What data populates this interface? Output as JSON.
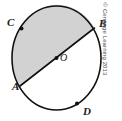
{
  "figure": {
    "type": "geometry-diagram",
    "shape": "circle",
    "circle": {
      "center_label": "O",
      "center": {
        "x": 56.5,
        "y": 58.0
      },
      "radius_x": 44.5,
      "radius_y": 52.0,
      "stroke_color": "#111111",
      "stroke_width": 1.6,
      "fill_color": "#ffffff"
    },
    "diameter": {
      "name": "AB",
      "from_label": "A",
      "to_label": "B",
      "from": {
        "x": 20.0,
        "y": 86.0
      },
      "to": {
        "x": 94.5,
        "y": 28.0
      },
      "stroke_color": "#111111",
      "stroke_width": 1.6
    },
    "shaded_region": {
      "name": "semicircle-ACB",
      "fill_color": "#d2d2d2",
      "side": "upper-left"
    },
    "unshaded_region": {
      "name": "semicircle-ADB",
      "fill_color": "#ffffff",
      "side": "lower-right"
    },
    "points": [
      {
        "label": "C",
        "x": 21.5,
        "y": 28.5,
        "label_x": 7,
        "label_y": 17,
        "marked": true,
        "on": "arc"
      },
      {
        "label": "B",
        "x": 94.5,
        "y": 28.0,
        "label_x": 99,
        "label_y": 18,
        "marked": false,
        "on": "arc"
      },
      {
        "label": "A",
        "x": 20.0,
        "y": 86.0,
        "label_x": 12,
        "label_y": 81,
        "marked": false,
        "on": "arc"
      },
      {
        "label": "D",
        "x": 77.0,
        "y": 103.5,
        "label_x": 83,
        "label_y": 106,
        "marked": true,
        "on": "arc"
      },
      {
        "label": "O",
        "x": 56.5,
        "y": 58.0,
        "label_x": 60,
        "label_y": 53,
        "marked": true,
        "on": "center"
      }
    ],
    "point_marker": {
      "color": "#111111",
      "radius": 2.0
    }
  },
  "credit": {
    "text": "© Cengage Learning 2013",
    "color": "#4d4d4d",
    "orientation": "vertical-right"
  }
}
